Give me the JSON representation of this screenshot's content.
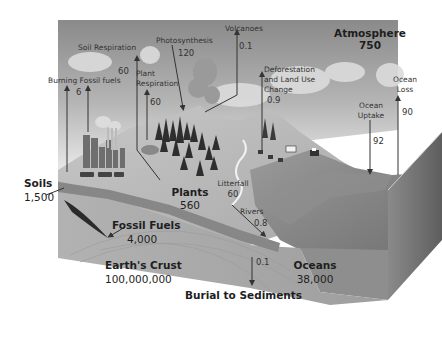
{
  "reservoirs": {
    "atmosphere": {
      "label": "Atmosphere",
      "value": "750"
    },
    "soils": {
      "label": "Soils",
      "value": "1,500"
    },
    "plants": {
      "label": "Plants",
      "value": "560"
    },
    "fossil_fuels": {
      "label": "Fossil Fuels",
      "value": "4,000"
    },
    "earths_crust": {
      "label": "Earth's Crust",
      "value": "100,000,000"
    },
    "oceans": {
      "label": "Oceans",
      "value": "38,000"
    }
  },
  "fluxes": {
    "soil_respiration": {
      "label": "Soil Respiration",
      "value": "60"
    },
    "photosynthesis": {
      "label": "Photosynthesis",
      "value": "120"
    },
    "volcanoes": {
      "label": "Volcanoes",
      "value": "0.1"
    },
    "burning_fossil_fuels": {
      "label": "Burning Fossil fuels",
      "value": "6"
    },
    "plant_respiration": {
      "label_line1": "Plant",
      "label_line2": "Respiration",
      "value": "60"
    },
    "deforestation": {
      "label_line1": "Deforestation",
      "label_line2": "and Land Use",
      "label_line3": "Change",
      "value": "0.9"
    },
    "ocean_uptake": {
      "label_line1": "Ocean",
      "label_line2": "Uptake",
      "value": "92"
    },
    "ocean_loss": {
      "label_line1": "Ocean",
      "label_line2": "Loss",
      "value": "90"
    },
    "litterfall": {
      "label": "Litterfall",
      "value": "60"
    },
    "rivers": {
      "label": "Rivers",
      "value": "0.8"
    },
    "burial": {
      "label": "Burial to Sediments",
      "value": "0.1"
    }
  },
  "colors": {
    "sky_dark": "#8c8c8c",
    "sky_light": "#e6e6e6",
    "land": "#bdbdbd",
    "crust": "#a9a9a9",
    "ocean_top": "#7a7a7a",
    "ocean_side": "#6a6a6a",
    "soil_band": "#8a8a8a",
    "fossil": "#2b2b2b",
    "arrow": "#3a3a3a"
  }
}
